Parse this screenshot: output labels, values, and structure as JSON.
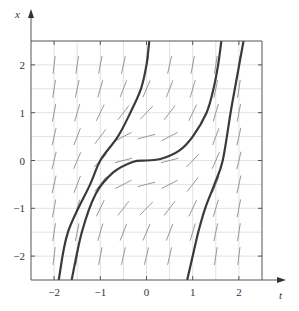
{
  "chart_data": {
    "type": "line",
    "title": "",
    "subtitle": "Direction field with solution curves",
    "xlabel": "t",
    "ylabel": "x",
    "xlim": [
      -2.5,
      2.5
    ],
    "ylim": [
      -2.5,
      2.5
    ],
    "x_ticks": [
      -2,
      -1,
      0,
      1,
      2
    ],
    "y_ticks": [
      -2,
      -1,
      0,
      1,
      2
    ],
    "x_tick_labels": [
      "−2",
      "−1",
      "0",
      "1",
      "2"
    ],
    "y_tick_labels": [
      "−2",
      "−1",
      "0",
      "1",
      "2"
    ],
    "grid": true,
    "grid_step": 0.5,
    "legend": null,
    "direction_field": {
      "t_points": [
        -2,
        -1.5,
        -1,
        -0.5,
        0,
        0.5,
        1,
        1.5,
        2
      ],
      "x_points": [
        -2,
        -1.5,
        -1,
        -0.5,
        0,
        0.5,
        1,
        1.5,
        2
      ],
      "slope_model": "x^2 + t^2"
    },
    "series": [
      {
        "name": "solution-1",
        "points": [
          [
            -1.9,
            -2.5
          ],
          [
            -1.7,
            -1.5
          ],
          [
            -1.22,
            -0.5
          ],
          [
            -1.0,
            0.0
          ],
          [
            -0.62,
            0.5
          ],
          [
            -0.35,
            1.0
          ],
          [
            -0.12,
            1.5
          ],
          [
            0.0,
            2.0
          ],
          [
            0.06,
            2.5
          ]
        ]
      },
      {
        "name": "solution-2",
        "points": [
          [
            -1.62,
            -2.5
          ],
          [
            -1.4,
            -1.5
          ],
          [
            -1.1,
            -0.7
          ],
          [
            -0.72,
            -0.25
          ],
          [
            -0.3,
            -0.03
          ],
          [
            0.0,
            0.0
          ],
          [
            0.3,
            0.03
          ],
          [
            0.7,
            0.2
          ],
          [
            1.0,
            0.5
          ],
          [
            1.3,
            1.0
          ],
          [
            1.45,
            1.5
          ],
          [
            1.55,
            2.0
          ],
          [
            1.62,
            2.5
          ]
        ]
      },
      {
        "name": "solution-3",
        "points": [
          [
            0.88,
            -2.5
          ],
          [
            1.0,
            -2.0
          ],
          [
            1.12,
            -1.5
          ],
          [
            1.27,
            -1.0
          ],
          [
            1.47,
            -0.5
          ],
          [
            1.65,
            0.0
          ],
          [
            1.82,
            1.0
          ],
          [
            1.95,
            1.7
          ],
          [
            2.1,
            2.5
          ]
        ]
      }
    ]
  },
  "colors": {
    "curve": "#3a3a3a",
    "field": "#8c8c8c",
    "grid": "#e2e2e2",
    "axis": "#555555"
  }
}
